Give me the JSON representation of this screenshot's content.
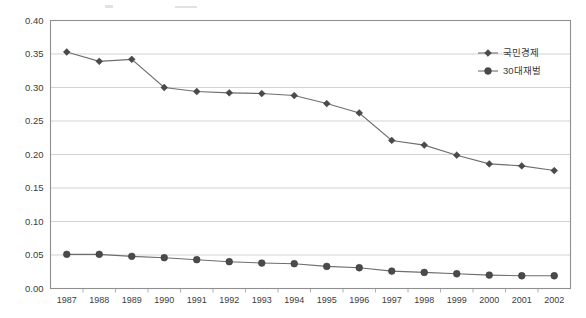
{
  "chart_data": {
    "type": "line",
    "title": "",
    "subtitle": "",
    "xlabel": "",
    "ylabel": "",
    "categories": [
      "1987",
      "1988",
      "1989",
      "1990",
      "1991",
      "1992",
      "1993",
      "1994",
      "1995",
      "1996",
      "1997",
      "1998",
      "1999",
      "2000",
      "2001",
      "2002"
    ],
    "ylim": [
      0.0,
      0.4
    ],
    "ytick_labels": [
      "0.00",
      "0.05",
      "0.10",
      "0.15",
      "0.20",
      "0.25",
      "0.30",
      "0.35",
      "0.40"
    ],
    "ytick_values": [
      0.0,
      0.05,
      0.1,
      0.15,
      0.2,
      0.25,
      0.3,
      0.35,
      0.4
    ],
    "grid": true,
    "legend_position": "top-right",
    "series": [
      {
        "name": "국민경제",
        "marker": "diamond",
        "color": "#4a4a4a",
        "values": [
          0.353,
          0.339,
          0.342,
          0.3,
          0.294,
          0.292,
          0.291,
          0.288,
          0.276,
          0.262,
          0.221,
          0.214,
          0.199,
          0.186,
          0.183,
          0.176
        ]
      },
      {
        "name": "30대재벌",
        "marker": "circle",
        "color": "#4a4a4a",
        "values": [
          0.051,
          0.051,
          0.048,
          0.046,
          0.043,
          0.04,
          0.038,
          0.037,
          0.033,
          0.031,
          0.026,
          0.024,
          0.022,
          0.02,
          0.019,
          0.019
        ]
      }
    ]
  },
  "legend": {
    "entries": [
      {
        "label": "국민경제"
      },
      {
        "label": "30대재벌"
      }
    ]
  },
  "axes": {
    "y_min_label": "0.00",
    "y_max_label": "0.40"
  }
}
